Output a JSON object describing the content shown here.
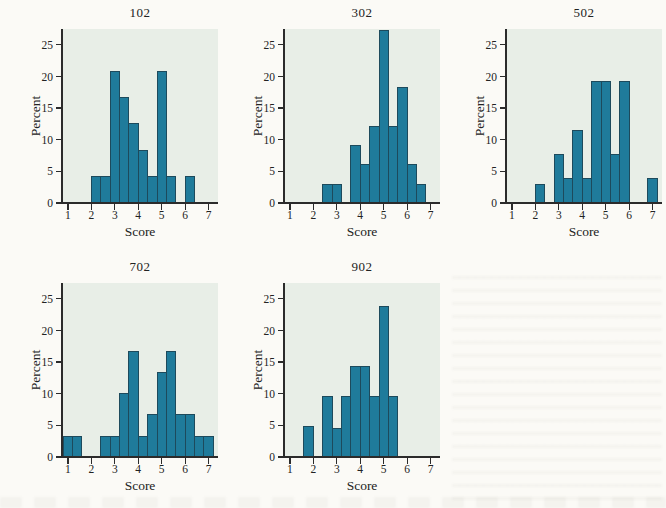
{
  "page": {
    "background_color": "#fbfaf6",
    "figure_kind": "five-panel histogram figure of course section score distributions"
  },
  "colors": {
    "bar_fill": "#1f7b9b",
    "bar_stroke": "#1d4a5c",
    "plot_background": "#e8eee7",
    "axis": "#2b2b2b",
    "text": "#222222"
  },
  "chart_data": [
    {
      "type": "bar",
      "title": "102",
      "xlabel": "Score",
      "ylabel": "Percent",
      "bin_width": 0.4,
      "xlim": [
        0.75,
        7.4
      ],
      "ylim": [
        0,
        27.5
      ],
      "x_ticks": [
        1,
        2,
        3,
        4,
        5,
        6,
        7
      ],
      "y_ticks": [
        0,
        5,
        10,
        15,
        20,
        25
      ],
      "grid": false,
      "legend": "none",
      "bars": [
        {
          "x0": 2.0,
          "pct": 4.2
        },
        {
          "x0": 2.4,
          "pct": 4.2
        },
        {
          "x0": 2.8,
          "pct": 20.8
        },
        {
          "x0": 3.2,
          "pct": 16.7
        },
        {
          "x0": 3.6,
          "pct": 12.5
        },
        {
          "x0": 4.0,
          "pct": 8.3
        },
        {
          "x0": 4.4,
          "pct": 4.2
        },
        {
          "x0": 4.8,
          "pct": 20.8
        },
        {
          "x0": 5.2,
          "pct": 4.2
        },
        {
          "x0": 6.0,
          "pct": 4.2
        }
      ]
    },
    {
      "type": "bar",
      "title": "302",
      "xlabel": "Score",
      "ylabel": "Percent",
      "bin_width": 0.4,
      "xlim": [
        0.75,
        7.4
      ],
      "ylim": [
        0,
        27.5
      ],
      "x_ticks": [
        1,
        2,
        3,
        4,
        5,
        6,
        7
      ],
      "y_ticks": [
        0,
        5,
        10,
        15,
        20,
        25
      ],
      "grid": false,
      "legend": "none",
      "bars": [
        {
          "x0": 2.4,
          "pct": 3.0
        },
        {
          "x0": 2.8,
          "pct": 3.0
        },
        {
          "x0": 3.6,
          "pct": 9.1
        },
        {
          "x0": 4.0,
          "pct": 6.1
        },
        {
          "x0": 4.4,
          "pct": 12.1
        },
        {
          "x0": 4.8,
          "pct": 27.3
        },
        {
          "x0": 5.2,
          "pct": 12.1
        },
        {
          "x0": 5.6,
          "pct": 18.2
        },
        {
          "x0": 6.0,
          "pct": 6.1
        },
        {
          "x0": 6.4,
          "pct": 3.0
        }
      ]
    },
    {
      "type": "bar",
      "title": "502",
      "xlabel": "Score",
      "ylabel": "Percent",
      "bin_width": 0.4,
      "xlim": [
        0.75,
        7.4
      ],
      "ylim": [
        0,
        27.5
      ],
      "x_ticks": [
        1,
        2,
        3,
        4,
        5,
        6,
        7
      ],
      "y_ticks": [
        0,
        5,
        10,
        15,
        20,
        25
      ],
      "grid": false,
      "legend": "none",
      "bars": [
        {
          "x0": 2.0,
          "pct": 3.0
        },
        {
          "x0": 2.8,
          "pct": 7.7
        },
        {
          "x0": 3.2,
          "pct": 3.8
        },
        {
          "x0": 3.6,
          "pct": 11.5
        },
        {
          "x0": 4.0,
          "pct": 3.8
        },
        {
          "x0": 4.4,
          "pct": 19.2
        },
        {
          "x0": 4.8,
          "pct": 19.2
        },
        {
          "x0": 5.2,
          "pct": 7.7
        },
        {
          "x0": 5.6,
          "pct": 19.2
        },
        {
          "x0": 6.8,
          "pct": 3.8
        }
      ]
    },
    {
      "type": "bar",
      "title": "702",
      "xlabel": "Score",
      "ylabel": "Percent",
      "bin_width": 0.4,
      "xlim": [
        0.75,
        7.4
      ],
      "ylim": [
        0,
        27.5
      ],
      "x_ticks": [
        1,
        2,
        3,
        4,
        5,
        6,
        7
      ],
      "y_ticks": [
        0,
        5,
        10,
        15,
        20,
        25
      ],
      "grid": false,
      "legend": "none",
      "bars": [
        {
          "x0": 0.8,
          "pct": 3.3
        },
        {
          "x0": 1.2,
          "pct": 3.3
        },
        {
          "x0": 2.4,
          "pct": 3.3
        },
        {
          "x0": 2.8,
          "pct": 3.3
        },
        {
          "x0": 3.2,
          "pct": 10.0
        },
        {
          "x0": 3.6,
          "pct": 16.7
        },
        {
          "x0": 4.0,
          "pct": 3.3
        },
        {
          "x0": 4.4,
          "pct": 6.7
        },
        {
          "x0": 4.8,
          "pct": 13.3
        },
        {
          "x0": 5.2,
          "pct": 16.7
        },
        {
          "x0": 5.6,
          "pct": 6.7
        },
        {
          "x0": 6.0,
          "pct": 6.7
        },
        {
          "x0": 6.4,
          "pct": 3.3
        },
        {
          "x0": 6.8,
          "pct": 3.3
        }
      ]
    },
    {
      "type": "bar",
      "title": "902",
      "xlabel": "Score",
      "ylabel": "Percent",
      "bin_width": 0.4,
      "xlim": [
        0.75,
        7.4
      ],
      "ylim": [
        0,
        27.5
      ],
      "x_ticks": [
        1,
        2,
        3,
        4,
        5,
        6,
        7
      ],
      "y_ticks": [
        0,
        5,
        10,
        15,
        20,
        25
      ],
      "grid": false,
      "legend": "none",
      "bars": [
        {
          "x0": 1.6,
          "pct": 4.8
        },
        {
          "x0": 2.4,
          "pct": 9.5
        },
        {
          "x0": 2.8,
          "pct": 4.5
        },
        {
          "x0": 3.2,
          "pct": 9.5
        },
        {
          "x0": 3.6,
          "pct": 14.3
        },
        {
          "x0": 4.0,
          "pct": 14.3
        },
        {
          "x0": 4.4,
          "pct": 9.5
        },
        {
          "x0": 4.8,
          "pct": 23.8
        },
        {
          "x0": 5.2,
          "pct": 9.5
        }
      ]
    }
  ]
}
